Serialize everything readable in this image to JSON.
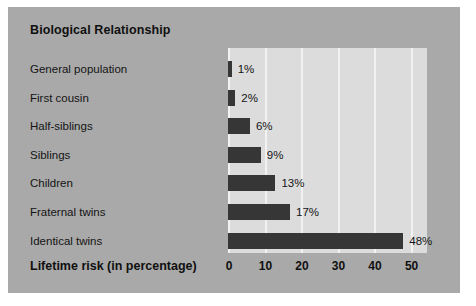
{
  "chart_data": {
    "type": "bar",
    "orientation": "horizontal",
    "title": "Biological Relationship",
    "xlabel": "Lifetime risk (in percentage)",
    "ylabel": "",
    "categories": [
      "General population",
      "First cousin",
      "Half-siblings",
      "Siblings",
      "Children",
      "Fraternal twins",
      "Identical twins"
    ],
    "values": [
      1,
      2,
      6,
      9,
      13,
      17,
      48
    ],
    "value_labels": [
      "1%",
      "2%",
      "6%",
      "9%",
      "13%",
      "17%",
      "48%"
    ],
    "xticks": [
      0,
      10,
      20,
      30,
      40,
      50
    ],
    "xtick_labels": [
      "0",
      "10",
      "20",
      "30",
      "40",
      "50"
    ],
    "xlim": [
      0,
      54.5
    ],
    "grid": true,
    "grid_axis": "x",
    "legend": "none",
    "colors": {
      "bar": "#363636",
      "plot_background": "#dcdcdc",
      "figure_background": "#a9a9a9",
      "gridline": "#f2f2f2",
      "text": "#141414"
    }
  }
}
